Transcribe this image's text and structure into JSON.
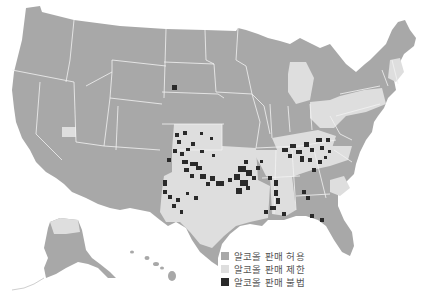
{
  "map": {
    "title": "",
    "colors": {
      "allowed": "#a8a8a8",
      "restricted": "#dedede",
      "prohibited": "#2a2a2a",
      "border": "#f2f2f2",
      "background": "#ffffff"
    }
  },
  "legend": {
    "items": [
      {
        "key": "allowed",
        "label": "알코올 판매 허용",
        "color": "#a8a8a8"
      },
      {
        "key": "restricted",
        "label": "알코올 판매 제한",
        "color": "#dedede"
      },
      {
        "key": "prohibited",
        "label": "알코올 판매 불법",
        "color": "#2a2a2a"
      }
    ]
  }
}
